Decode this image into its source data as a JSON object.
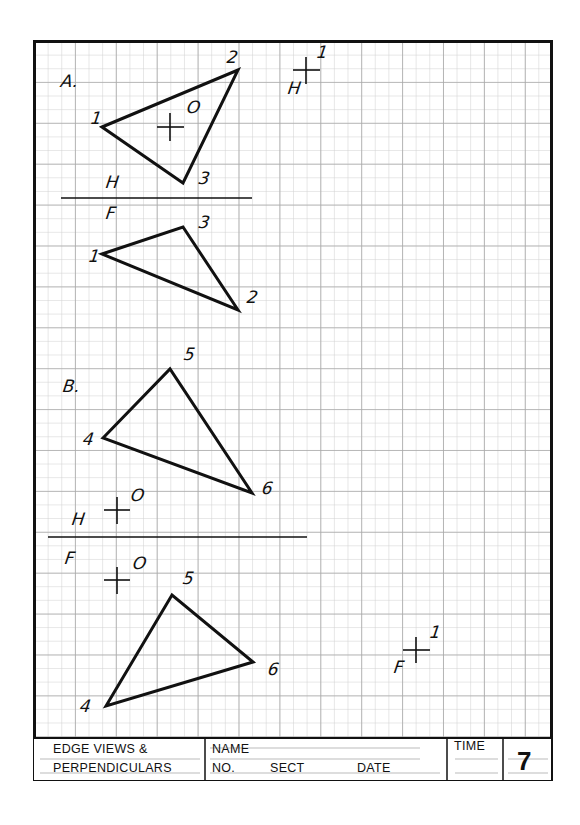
{
  "sheet": {
    "title_block": {
      "title_line1": "EDGE VIEWS &",
      "title_line2": "PERPENDICULARS",
      "name_label": "NAME",
      "no_label": "NO.",
      "sect_label": "SECT",
      "date_label": "DATE",
      "time_label": "TIME",
      "sheet_number": "7"
    },
    "problem_a": {
      "label": "A.",
      "horizontal_view": {
        "plane_label": "H",
        "points": [
          {
            "name": "1",
            "x": 102,
            "y": 127
          },
          {
            "name": "2",
            "x": 238,
            "y": 70
          },
          {
            "name": "3",
            "x": 183,
            "y": 183
          }
        ],
        "point_o": {
          "name": "O",
          "x": 170,
          "y": 127
        }
      },
      "folding_line": "H/F",
      "front_view": {
        "plane_label": "F",
        "points": [
          {
            "name": "1",
            "x": 102,
            "y": 254
          },
          {
            "name": "3",
            "x": 183,
            "y": 227
          },
          {
            "name": "2",
            "x": 238,
            "y": 310
          }
        ]
      },
      "point_1_marker": {
        "label_point": "1",
        "label_plane": "H"
      }
    },
    "problem_b": {
      "label": "B.",
      "horizontal_view": {
        "plane_label": "H",
        "points": [
          {
            "name": "4",
            "x": 103,
            "y": 438
          },
          {
            "name": "5",
            "x": 170,
            "y": 369
          },
          {
            "name": "6",
            "x": 252,
            "y": 493
          }
        ],
        "point_o": {
          "name": "O",
          "x": 117,
          "y": 510
        }
      },
      "folding_line": "H/F",
      "front_view": {
        "plane_label": "F",
        "points": [
          {
            "name": "4",
            "x": 106,
            "y": 706
          },
          {
            "name": "5",
            "x": 172,
            "y": 595
          },
          {
            "name": "6",
            "x": 253,
            "y": 662
          }
        ],
        "point_o": {
          "name": "O",
          "x": 117,
          "y": 580
        }
      },
      "point_1_marker": {
        "label_point": "1",
        "label_plane": "F"
      }
    },
    "labels": {
      "a_label": "A.",
      "a_h": "H",
      "a_f": "F",
      "a_p1_top": "1",
      "a_p2_top": "2",
      "a_p3_top": "3",
      "a_o_top": "O",
      "a_p1_front": "1",
      "a_p3_front": "3",
      "a_p2_front": "2",
      "a_mark_1": "1",
      "a_mark_h": "H",
      "b_label": "B.",
      "b_p5_top": "5",
      "b_p4_top": "4",
      "b_p6_top": "6",
      "b_o_top": "O",
      "b_h": "H",
      "b_f": "F",
      "b_o_front": "O",
      "b_p5_front": "5",
      "b_p6_front": "6",
      "b_p4_front": "4",
      "b_mark_1": "1",
      "b_mark_f": "F"
    },
    "colors": {
      "grid_minor": "#c8c8c8",
      "grid_major": "#a8a8a8",
      "ink": "#111111",
      "paper": "#ffffff"
    }
  }
}
